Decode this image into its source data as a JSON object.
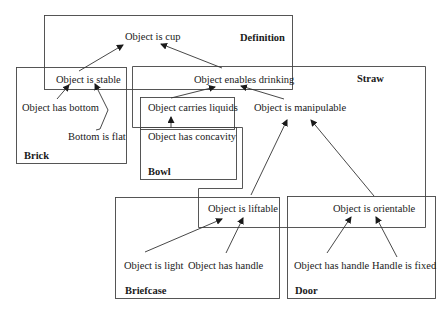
{
  "diagram": {
    "type": "concept-overlap-diagram",
    "regions": {
      "definition": "Definition",
      "straw": "Straw",
      "brick": "Brick",
      "bowl": "Bowl",
      "briefcase": "Briefcase",
      "door": "Door"
    },
    "nodes": {
      "object_is_cup": "Object is cup",
      "object_is_stable": "Object is stable",
      "object_enables_drinking": "Object enables drinking",
      "object_has_bottom": "Object has bottom",
      "bottom_is_flat": "Bottom is flat",
      "object_carries_liquids": "Object carries liquids",
      "object_has_concavity": "Object has concavity",
      "object_is_manipulable": "Object is manipulable",
      "object_is_liftable": "Object is liftable",
      "object_is_orientable": "Object is orientable",
      "object_is_light": "Object is light",
      "object_has_handle_briefcase": "Object has handle",
      "object_has_handle_door": "Object has handle",
      "handle_is_fixed": "Handle is fixed"
    },
    "edges": [
      {
        "from": "Object is stable",
        "to": "Object is cup"
      },
      {
        "from": "Object enables drinking",
        "to": "Object is cup"
      },
      {
        "from": "Object has bottom",
        "to": "Object is stable"
      },
      {
        "from": "Bottom is flat",
        "to": "Object is stable"
      },
      {
        "from": "Object carries liquids",
        "to": "Object enables drinking"
      },
      {
        "from": "Object is manipulable",
        "to": "Object enables drinking"
      },
      {
        "from": "Object has concavity",
        "to": "Object carries liquids"
      },
      {
        "from": "Object is liftable",
        "to": "Object is manipulable"
      },
      {
        "from": "Object is orientable",
        "to": "Object is manipulable"
      },
      {
        "from": "Object is light",
        "to": "Object is liftable"
      },
      {
        "from": "Object has handle",
        "to": "Object is liftable"
      },
      {
        "from": "Object has handle",
        "to": "Object is orientable"
      },
      {
        "from": "Handle is fixed",
        "to": "Object is orientable"
      }
    ],
    "line_color": "#333333"
  }
}
